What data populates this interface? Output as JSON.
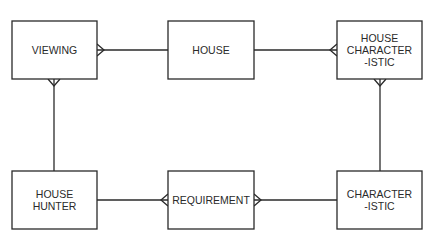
{
  "diagram": {
    "type": "entity-relationship",
    "notation": "crow's foot",
    "colors": {
      "stroke": "#2a2a2a",
      "background": "#ffffff",
      "text": "#2a2a2a"
    },
    "entities": [
      {
        "id": "viewing",
        "label_lines": [
          "VIEWING"
        ],
        "x": 12,
        "y": 21,
        "w": 85,
        "h": 58
      },
      {
        "id": "house",
        "label_lines": [
          "HOUSE"
        ],
        "x": 168,
        "y": 21,
        "w": 86,
        "h": 58
      },
      {
        "id": "house_characteristic",
        "label_lines": [
          "HOUSE",
          "CHARACTER",
          "-ISTIC"
        ],
        "x": 337,
        "y": 21,
        "w": 85,
        "h": 58
      },
      {
        "id": "house_hunter",
        "label_lines": [
          "HOUSE",
          "HUNTER"
        ],
        "x": 12,
        "y": 171,
        "w": 85,
        "h": 58
      },
      {
        "id": "requirement",
        "label_lines": [
          "REQUIREMENT"
        ],
        "x": 168,
        "y": 171,
        "w": 86,
        "h": 58
      },
      {
        "id": "characteristic",
        "label_lines": [
          "CHARACTER",
          "-ISTIC"
        ],
        "x": 337,
        "y": 171,
        "w": 85,
        "h": 58
      }
    ],
    "relationships": [
      {
        "from": "house",
        "to": "viewing",
        "from_card": "one",
        "to_card": "many"
      },
      {
        "from": "house",
        "to": "house_characteristic",
        "from_card": "one",
        "to_card": "many"
      },
      {
        "from": "house_hunter",
        "to": "viewing",
        "from_card": "one",
        "to_card": "many"
      },
      {
        "from": "characteristic",
        "to": "house_characteristic",
        "from_card": "one",
        "to_card": "many"
      },
      {
        "from": "house_hunter",
        "to": "requirement",
        "from_card": "one",
        "to_card": "many"
      },
      {
        "from": "characteristic",
        "to": "requirement",
        "from_card": "one",
        "to_card": "many"
      }
    ]
  }
}
